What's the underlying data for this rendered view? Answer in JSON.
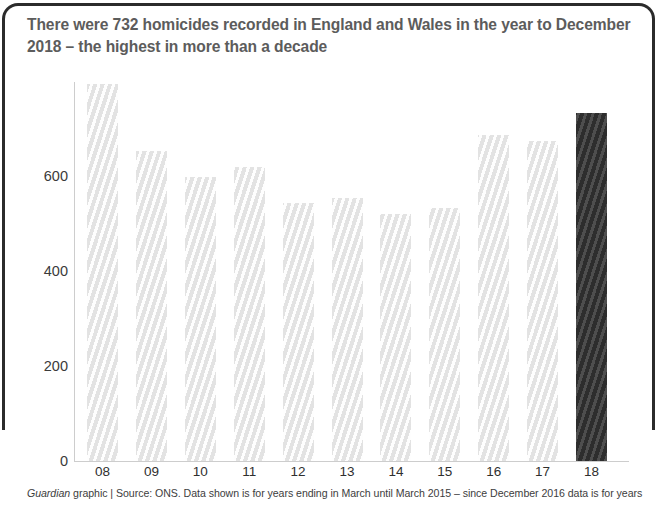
{
  "figure": {
    "title": "There were 732 homicides recorded in England and Wales in the year to December 2018 – the highest in more than a decade",
    "footer_italic": "Guardian",
    "footer_rest": " graphic | Source: ONS. Data shown is for years ending in March until March 2015 – since December 2016 data is for years",
    "colors": {
      "frame": "#2b2b2b",
      "title_text": "#5c5c5c",
      "bar_light": "#ededed",
      "bar_highlight": "#3a3a3a",
      "axis": "#cdcdcd",
      "tick_text": "#2f2f2f"
    }
  },
  "chart_data": {
    "type": "bar",
    "title": "There were 732 homicides recorded in England and Wales in the year to December 2018 – the highest in more than a decade",
    "xlabel": "",
    "ylabel": "",
    "categories": [
      "08",
      "09",
      "10",
      "11",
      "12",
      "13",
      "14",
      "15",
      "16",
      "17",
      "18"
    ],
    "values": [
      794,
      653,
      598,
      619,
      543,
      554,
      520,
      533,
      686,
      674,
      732
    ],
    "highlighted_category": "18",
    "highlighted_value": 732,
    "ylim": [
      0,
      800
    ],
    "yticks": [
      0,
      200,
      400,
      600
    ],
    "ytick_labels": [
      "0",
      "200",
      "400",
      "600"
    ],
    "grid": false,
    "legend": false
  }
}
